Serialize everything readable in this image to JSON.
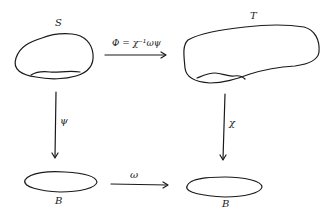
{
  "diagram": {
    "type": "commutative-diagram",
    "nodes": [
      {
        "id": "S",
        "label": "S",
        "shape": "blob-with-subregion"
      },
      {
        "id": "T",
        "label": "T",
        "shape": "large-blob-with-subregion"
      },
      {
        "id": "B_left",
        "label": "B",
        "shape": "ellipse"
      },
      {
        "id": "B_right",
        "label": "B",
        "shape": "ellipse"
      }
    ],
    "edges": [
      {
        "from": "S",
        "to": "T",
        "label": "Φ = χ⁻¹ωψ"
      },
      {
        "from": "S",
        "to": "B_left",
        "label": "ψ"
      },
      {
        "from": "T",
        "to": "B_right",
        "label": "χ"
      },
      {
        "from": "B_left",
        "to": "B_right",
        "label": "ω"
      }
    ],
    "colors": {
      "ink": "#1a1a1a",
      "background": "#ffffff"
    }
  }
}
